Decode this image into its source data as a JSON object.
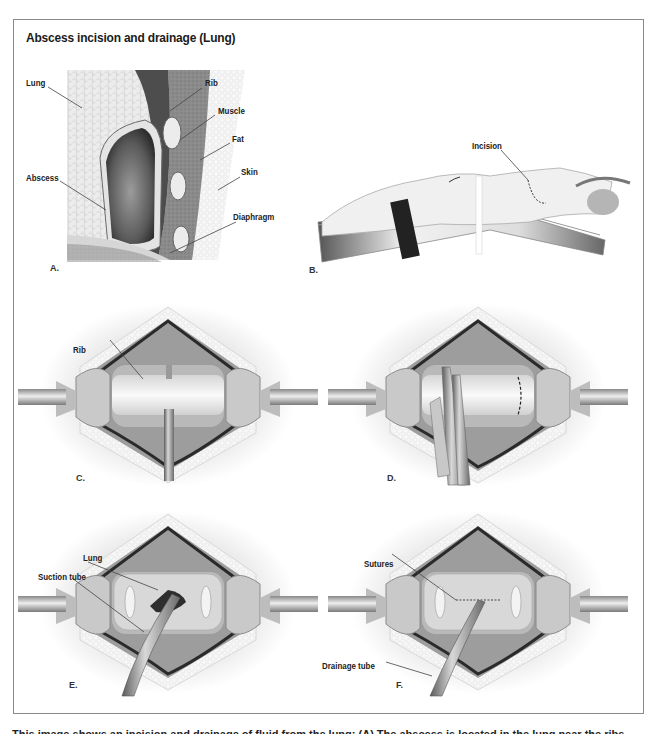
{
  "figure": {
    "title": "Abscess incision and drainage (Lung)",
    "caption_partial": "This image shows an incision and drainage of fluid from the lung: (A) The abscess is located in the lung near the ribs..."
  },
  "panels": {
    "A": {
      "letter": "A.",
      "labels": {
        "lung": "Lung",
        "rib": "Rib",
        "muscle": "Muscle",
        "fat": "Fat",
        "skin": "Skin",
        "abscess": "Abscess",
        "diaphragm": "Diaphragm"
      }
    },
    "B": {
      "letter": "B.",
      "labels": {
        "incision": "Incision"
      }
    },
    "C": {
      "letter": "C.",
      "labels": {
        "rib": "Rib"
      }
    },
    "D": {
      "letter": "D."
    },
    "E": {
      "letter": "E.",
      "labels": {
        "lung": "Lung",
        "suction_tube": "Suction tube"
      }
    },
    "F": {
      "letter": "F.",
      "labels": {
        "sutures": "Sutures",
        "drainage_tube": "Drainage tube"
      }
    }
  },
  "colors": {
    "frame": "#8a8a8a",
    "tissue": "#9a9a9a",
    "dark": "#2a2a2a",
    "light": "#e8e8e8"
  }
}
